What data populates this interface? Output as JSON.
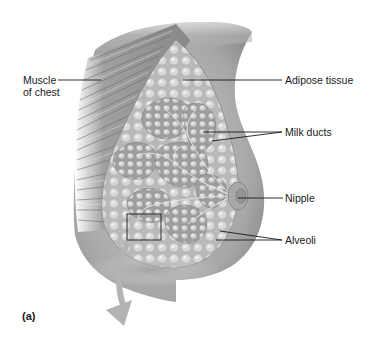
{
  "figure": {
    "panel_label": "(a)",
    "labels": {
      "muscle_line1": "Muscle",
      "muscle_line2": "of chest",
      "adipose": "Adipose tissue",
      "milk_ducts": "Milk ducts",
      "nipple": "Nipple",
      "alveoli": "Alveoli"
    },
    "colors": {
      "background": "#ffffff",
      "skin": "#9a9a9a",
      "skin_light": "#c8c8c8",
      "muscle": "#8c8c8c",
      "adipose": "#bdbdbd",
      "lobule": "#a8a8a8",
      "leader_line": "#1a1a1a",
      "arrow": "#b0b0b0"
    }
  }
}
